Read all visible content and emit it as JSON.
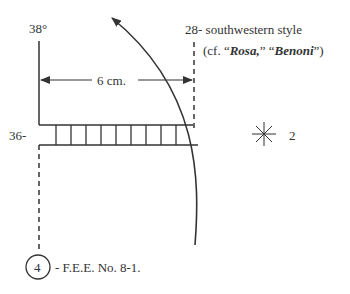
{
  "labels": {
    "top_left": "38°",
    "mid_left": "36-",
    "measure": "6 cm.",
    "top_right_line1": "28- southwestern style",
    "top_right_paren_open": "(cf. “",
    "top_right_rosa": "Rosa,",
    "top_right_mid": "” “",
    "top_right_benoni": "Benoni",
    "top_right_paren_close": "”)",
    "star_number": "2",
    "circle_number": "4",
    "bottom_caption": "- F.E.E. No. 8-1."
  },
  "ladder": {
    "rung_count": 9
  },
  "colors": {
    "ink": "#333333",
    "background": "#ffffff"
  }
}
